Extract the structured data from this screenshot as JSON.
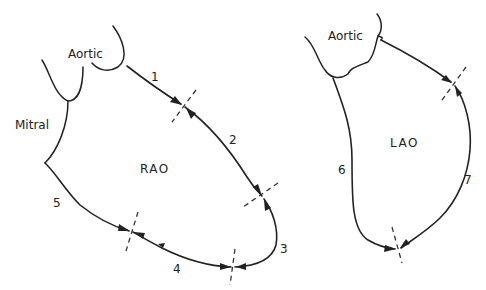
{
  "diagram": {
    "rao": {
      "view_label": "RAO",
      "valve_labels": {
        "aortic": "Aortic",
        "mitral": "Mitral"
      },
      "segments": [
        "1",
        "2",
        "3",
        "4",
        "5"
      ]
    },
    "lao": {
      "view_label": "LAO",
      "valve_labels": {
        "aortic": "Aortic"
      },
      "segments": [
        "6",
        "7"
      ]
    },
    "colors": {
      "line": "#222222",
      "background": "#ffffff"
    }
  }
}
